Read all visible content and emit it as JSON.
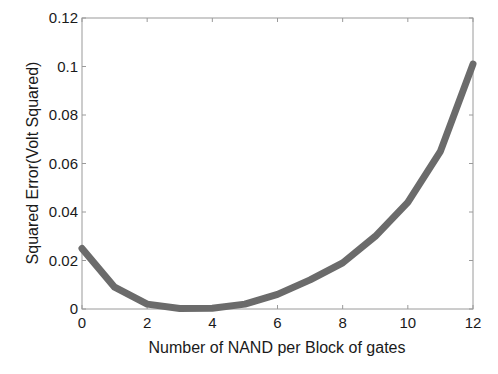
{
  "chart_data": {
    "type": "line",
    "title": "",
    "xlabel": "Number of NAND per Block of gates",
    "ylabel": "Squared Error(Volt Squared)",
    "xlim": [
      0,
      12
    ],
    "ylim": [
      0,
      0.12
    ],
    "xticks": [
      0,
      2,
      4,
      6,
      8,
      10,
      12
    ],
    "xtick_labels": [
      "0",
      "2",
      "4",
      "6",
      "8",
      "10",
      "12"
    ],
    "yticks": [
      0,
      0.02,
      0.04,
      0.06,
      0.08,
      0.1,
      0.12
    ],
    "ytick_labels": [
      "0",
      "0.02",
      "0.04",
      "0.06",
      "0.08",
      "0.1",
      "0.12"
    ],
    "grid": false,
    "legend": null,
    "series": [
      {
        "name": "Squared Error",
        "color": "#6b6b6b",
        "x": [
          0,
          1,
          2,
          3,
          4,
          5,
          6,
          7,
          8,
          9,
          10,
          11,
          12
        ],
        "values": [
          0.025,
          0.009,
          0.002,
          0.0002,
          0.0003,
          0.002,
          0.006,
          0.012,
          0.019,
          0.03,
          0.044,
          0.065,
          0.101
        ]
      }
    ]
  }
}
